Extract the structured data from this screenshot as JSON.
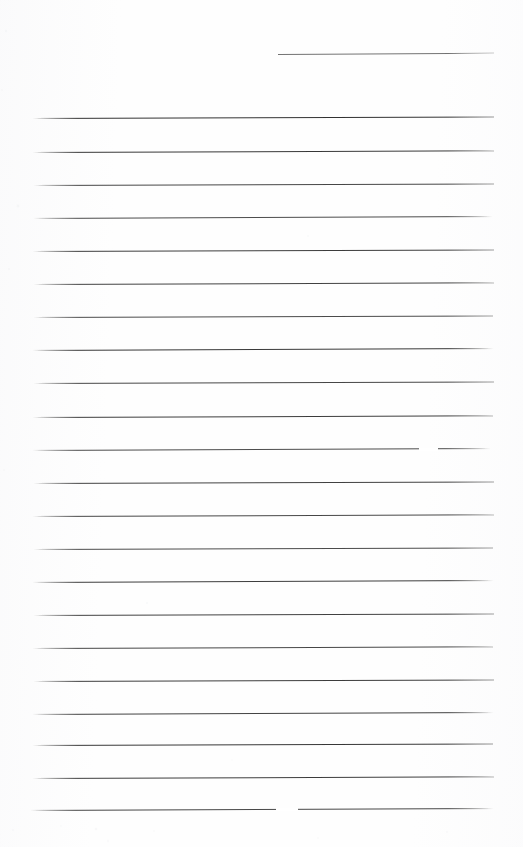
{
  "document": {
    "kind": "scanned-lined-paper",
    "title": "Blank ruled notebook page",
    "page_width": 523,
    "page_height": 847,
    "background_color": "#fefefe",
    "rule_color": "#c9ccd1",
    "text_content": "",
    "visible_text": []
  },
  "ruling": {
    "style": "wide ruled",
    "line_count": 23,
    "line_spacing_px": 33,
    "left_margin_px": 32,
    "right_margin_px": 494,
    "margin_rule": "none",
    "slant_deg": -0.22,
    "lines": [
      {
        "id": "line-01",
        "y": 54,
        "x_start": 278,
        "x_end": 494,
        "opacity": 0.55,
        "slant": -0.3,
        "partial": true
      },
      {
        "id": "line-02",
        "y": 118,
        "x_start": 32,
        "x_end": 494,
        "opacity": 0.8,
        "slant": -0.2,
        "partial": false
      },
      {
        "id": "line-03",
        "y": 152,
        "x_start": 32,
        "x_end": 494,
        "opacity": 0.78,
        "slant": -0.22,
        "partial": false
      },
      {
        "id": "line-04",
        "y": 185,
        "x_start": 33,
        "x_end": 494,
        "opacity": 0.72,
        "slant": -0.2,
        "partial": false
      },
      {
        "id": "line-05",
        "y": 218,
        "x_start": 33,
        "x_end": 493,
        "opacity": 0.7,
        "slant": -0.24,
        "partial": false
      },
      {
        "id": "line-06",
        "y": 251,
        "x_start": 32,
        "x_end": 494,
        "opacity": 0.76,
        "slant": -0.2,
        "partial": false
      },
      {
        "id": "line-07",
        "y": 284,
        "x_start": 33,
        "x_end": 494,
        "opacity": 0.74,
        "slant": -0.22,
        "partial": false
      },
      {
        "id": "line-08",
        "y": 317,
        "x_start": 33,
        "x_end": 493,
        "opacity": 0.7,
        "slant": -0.2,
        "partial": false
      },
      {
        "id": "line-09",
        "y": 350,
        "x_start": 32,
        "x_end": 494,
        "opacity": 0.78,
        "slant": -0.24,
        "partial": false
      },
      {
        "id": "line-10",
        "y": 383,
        "x_start": 33,
        "x_end": 494,
        "opacity": 0.72,
        "slant": -0.2,
        "partial": false
      },
      {
        "id": "line-11",
        "y": 417,
        "x_start": 32,
        "x_end": 493,
        "opacity": 0.76,
        "slant": -0.22,
        "partial": false
      },
      {
        "id": "line-12",
        "y": 450,
        "x_start": 32,
        "x_end": 491,
        "opacity": 0.7,
        "slant": -0.24,
        "partial": false
      },
      {
        "id": "line-13",
        "y": 483,
        "x_start": 33,
        "x_end": 494,
        "opacity": 0.74,
        "slant": -0.2,
        "partial": false
      },
      {
        "id": "line-14",
        "y": 516,
        "x_start": 32,
        "x_end": 494,
        "opacity": 0.72,
        "slant": -0.22,
        "partial": false
      },
      {
        "id": "line-15",
        "y": 549,
        "x_start": 33,
        "x_end": 493,
        "opacity": 0.7,
        "slant": -0.2,
        "partial": false
      },
      {
        "id": "line-16",
        "y": 582,
        "x_start": 32,
        "x_end": 494,
        "opacity": 0.76,
        "slant": -0.24,
        "partial": false
      },
      {
        "id": "line-17",
        "y": 615,
        "x_start": 33,
        "x_end": 494,
        "opacity": 0.74,
        "slant": -0.2,
        "partial": false
      },
      {
        "id": "line-18",
        "y": 648,
        "x_start": 32,
        "x_end": 493,
        "opacity": 0.72,
        "slant": -0.22,
        "partial": false
      },
      {
        "id": "line-19",
        "y": 681,
        "x_start": 33,
        "x_end": 494,
        "opacity": 0.76,
        "slant": -0.2,
        "partial": false
      },
      {
        "id": "line-20",
        "y": 714,
        "x_start": 32,
        "x_end": 494,
        "opacity": 0.74,
        "slant": -0.24,
        "partial": false
      },
      {
        "id": "line-21",
        "y": 745,
        "x_start": 32,
        "x_end": 493,
        "opacity": 0.78,
        "slant": -0.2,
        "partial": false
      },
      {
        "id": "line-22",
        "y": 778,
        "x_start": 32,
        "x_end": 494,
        "opacity": 0.76,
        "slant": -0.22,
        "partial": false
      },
      {
        "id": "line-23",
        "y": 810,
        "x_start": 30,
        "x_end": 494,
        "opacity": 0.72,
        "slant": -0.24,
        "partial": false
      }
    ],
    "gaps": [
      {
        "id": "gap-01",
        "x": 419,
        "y": 449,
        "width": 19
      },
      {
        "id": "gap-02",
        "x": 276,
        "y": 809,
        "width": 22
      }
    ]
  },
  "speckles": [
    {
      "x": 18,
      "y": 206,
      "r": 1.4,
      "o": 0.3
    },
    {
      "x": 9,
      "y": 269,
      "r": 1.1,
      "o": 0.26
    },
    {
      "x": 6,
      "y": 31,
      "r": 1.2,
      "o": 0.24
    },
    {
      "x": 308,
      "y": 236,
      "r": 1.0,
      "o": 0.22
    },
    {
      "x": 147,
      "y": 603,
      "r": 1.1,
      "o": 0.25
    },
    {
      "x": 96,
      "y": 829,
      "r": 1.3,
      "o": 0.28
    },
    {
      "x": 154,
      "y": 831,
      "r": 1.0,
      "o": 0.24
    },
    {
      "x": 108,
      "y": 841,
      "r": 1.2,
      "o": 0.22
    },
    {
      "x": 447,
      "y": 832,
      "r": 1.1,
      "o": 0.26
    },
    {
      "x": 13,
      "y": 830,
      "r": 1.0,
      "o": 0.25
    },
    {
      "x": 61,
      "y": 826,
      "r": 0.9,
      "o": 0.2
    },
    {
      "x": 318,
      "y": 838,
      "r": 1.0,
      "o": 0.24
    },
    {
      "x": 2,
      "y": 90,
      "r": 1.1,
      "o": 0.2
    },
    {
      "x": 4,
      "y": 470,
      "r": 1.0,
      "o": 0.2
    },
    {
      "x": 232,
      "y": 760,
      "r": 0.9,
      "o": 0.18
    }
  ]
}
